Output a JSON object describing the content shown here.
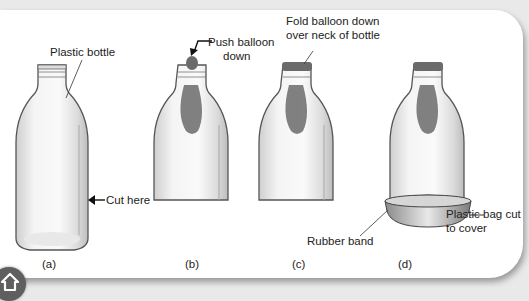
{
  "figure": {
    "panels": [
      {
        "id": "a",
        "caption": "(a)",
        "labels": [
          "Plastic bottle",
          "Cut here"
        ]
      },
      {
        "id": "b",
        "caption": "(b)",
        "labels": [
          "Push balloon",
          "down"
        ]
      },
      {
        "id": "c",
        "caption": "(c)",
        "labels": [
          "Fold balloon down",
          "over neck of bottle"
        ]
      },
      {
        "id": "d",
        "caption": "(d)",
        "labels": [
          "Rubber band",
          "Plastic bag cut",
          "to cover"
        ]
      }
    ]
  },
  "nav": {
    "home_icon": "home-icon"
  },
  "colors": {
    "balloon": "#6b6b6b",
    "bottle_outline": "#555555",
    "panel_bg": "#ffffff",
    "page_bg": "#e9e9e9"
  }
}
